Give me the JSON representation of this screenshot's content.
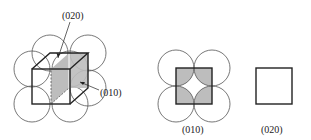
{
  "figure": {
    "labels": {
      "plane_020_top": "(020)",
      "plane_010_side": "(010)",
      "caption_010": "(010)",
      "caption_020": "(020)"
    },
    "colors": {
      "stroke": "#222222",
      "circle_stroke": "#555555",
      "shade": "#bdbdbd",
      "background": "#ffffff"
    }
  }
}
